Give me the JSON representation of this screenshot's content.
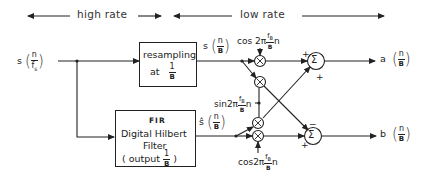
{
  "header": {
    "high_rate_label": "high rate",
    "low_rate_label": "low rate"
  },
  "input": {
    "signal_name": "s",
    "num": "n",
    "den": "f",
    "den_sub": "s"
  },
  "resampling_block": {
    "line1": "resampling",
    "line2_prefix": "at",
    "num": "1",
    "den": "B"
  },
  "resampled_signal": {
    "signal_name": "s",
    "num": "n",
    "den": "B"
  },
  "hilbert_block": {
    "line1": "FIR",
    "line2": "Digital  Hilbert",
    "line3": "Filter",
    "line4_prefix": "( output",
    "num": "1",
    "den": "B",
    "line4_suffix": ")"
  },
  "hilbert_signal": {
    "signal_name": "ŝ",
    "num": "n",
    "den": "B"
  },
  "modulators": {
    "cos_top": {
      "prefix": "cos 2π",
      "num": "f",
      "num_sub": "B",
      "den": "B",
      "suffix": "n"
    },
    "sin_mid": {
      "prefix": "sin2π",
      "num": "f",
      "num_sub": "B",
      "den": "B",
      "suffix": "n"
    },
    "cos_bottom": {
      "prefix": "cos2π",
      "num": "f",
      "num_sub": "B",
      "den": "B",
      "suffix": "n"
    },
    "multiplier_symbol": "×"
  },
  "summers": {
    "symbol": "Σ",
    "top_signs": {
      "left": "+",
      "bottom": "+"
    },
    "bottom_signs": {
      "top": "−",
      "left": "+"
    }
  },
  "outputs": {
    "a": {
      "signal_name": "a",
      "num": "n",
      "den": "B"
    },
    "b": {
      "signal_name": "b",
      "num": "n",
      "den": "B"
    }
  }
}
